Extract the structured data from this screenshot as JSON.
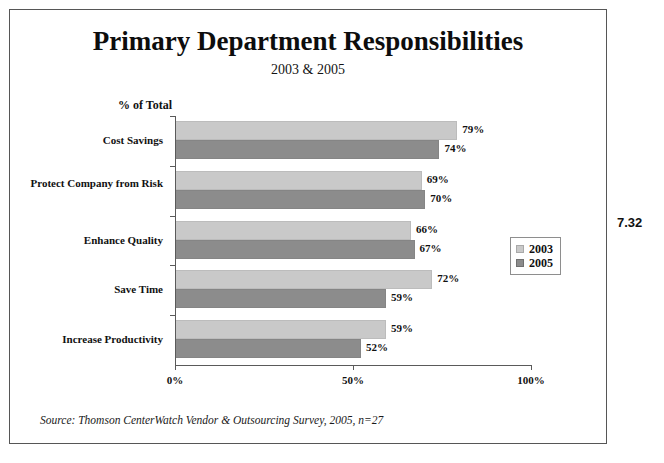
{
  "figure_number": "7.32",
  "source_note": "Source: Thomson CenterWatch Vendor & Outsourcing Survey, 2005, n=27",
  "legend": {
    "position": "right-middle",
    "items": [
      {
        "label": "2003",
        "color": "#c9c9c9"
      },
      {
        "label": "2005",
        "color": "#8c8c8c"
      }
    ]
  },
  "chart_data": {
    "type": "bar",
    "orientation": "horizontal",
    "title": "Primary Department Responsibilities",
    "subtitle": "2003 & 2005",
    "xlabel": "",
    "ylabel": "",
    "axis_title": "% of Total",
    "categories": [
      "Cost Savings",
      "Protect Company from Risk",
      "Enhance Quality",
      "Save Time",
      "Increase Productivity"
    ],
    "series": [
      {
        "name": "2003",
        "color": "#c9c9c9",
        "values": [
          79,
          69,
          66,
          72,
          59
        ],
        "labels": [
          "79%",
          "69%",
          "66%",
          "72%",
          "59%"
        ]
      },
      {
        "name": "2005",
        "color": "#8c8c8c",
        "values": [
          74,
          70,
          67,
          59,
          52
        ],
        "labels": [
          "74%",
          "70%",
          "67%",
          "59%",
          "52%"
        ]
      }
    ],
    "xlim": [
      0,
      100
    ],
    "xticks": [
      0,
      50,
      100
    ],
    "xtick_labels": [
      "0%",
      "50%",
      "100%"
    ],
    "grid": false
  }
}
